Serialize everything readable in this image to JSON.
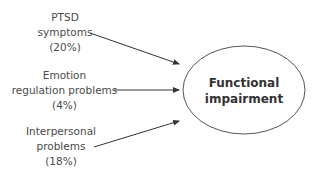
{
  "diagram": {
    "type": "path-diagram",
    "predictors": [
      {
        "lines": [
          "PTSD",
          "symptoms",
          "(20%)"
        ],
        "name": "PTSD symptoms",
        "percent": "20%"
      },
      {
        "lines": [
          "Emotion",
          "regulation problems",
          "(4%)"
        ],
        "name": "Emotion regulation problems",
        "percent": "4%"
      },
      {
        "lines": [
          "Interpersonal",
          "problems",
          "(18%)"
        ],
        "name": "Interpersonal problems",
        "percent": "18%"
      }
    ],
    "outcome": {
      "lines": [
        "Functional",
        "impairment"
      ],
      "name": "Functional impairment"
    },
    "colors": {
      "line": "#333333",
      "text": "#4a4a4a",
      "ellipse": "#555555"
    }
  }
}
